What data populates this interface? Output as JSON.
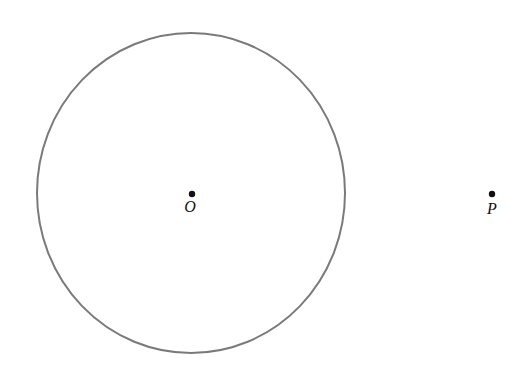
{
  "diagram": {
    "type": "geometry",
    "circle": {
      "cx": 191,
      "cy": 193,
      "rx": 154,
      "ry": 160,
      "stroke": "#7a7a7a",
      "stroke_width": 2
    },
    "points": [
      {
        "name": "O",
        "label": "O",
        "x": 192,
        "y": 194,
        "label_x": 190,
        "label_y": 199
      },
      {
        "name": "P",
        "label": "P",
        "x": 492,
        "y": 194,
        "label_x": 492,
        "label_y": 201
      }
    ],
    "point_color": "#111111"
  }
}
